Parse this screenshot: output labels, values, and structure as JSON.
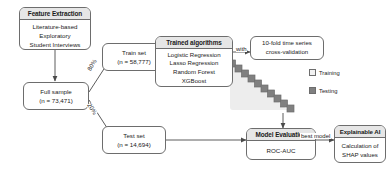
{
  "diagram": {
    "colors": {
      "header_fill": "#e6e6e6",
      "node_border": "#6d6d6d",
      "training_swatch": "#f2f2f2",
      "testing_swatch": "#808080",
      "background": "#ffffff"
    }
  },
  "nodes": {
    "feature_extraction": {
      "header": "Feature Extraction",
      "items": [
        "Literature-based",
        "Exploratory",
        "Student Interviews"
      ]
    },
    "full_sample": {
      "line1": "Full sample",
      "line2": "(n = 73,471)"
    },
    "train_set": {
      "line1": "Train set",
      "line2": "(n = 58,777)"
    },
    "test_set": {
      "line1": "Test set",
      "line2": "(n = 14,694)"
    },
    "trained_algorithms": {
      "header": "Trained algorithms",
      "items": [
        "Logistic Regression",
        "Lasso Regression",
        "Random Forest",
        "XGBoost"
      ]
    },
    "cross_validation": {
      "line1": "10-fold time series",
      "line2": "cross-validation"
    },
    "model_evaluation": {
      "header": "Model Evaluation",
      "items": [
        "ROC-AUC"
      ]
    },
    "explainable_ai": {
      "header": "Explainable AI",
      "items": [
        "Calculation of",
        "SHAP values"
      ]
    }
  },
  "edge_labels": {
    "train_split": "80%",
    "test_split": "20%",
    "with": "with",
    "best_model": "best model"
  },
  "legend": {
    "items": [
      {
        "label": "Training",
        "swatch": "light-square"
      },
      {
        "label": "Testing",
        "swatch": "dark-square"
      }
    ]
  },
  "cv_matrix": {
    "folds": 10,
    "description": "staircase of 10 diagonal testing cells over a shaded training region"
  }
}
